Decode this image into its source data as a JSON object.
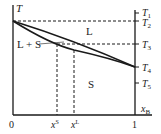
{
  "diagram": {
    "type": "binary phase diagram",
    "y_axis_label": "T",
    "x_axis_label": "x",
    "x_axis_label_sub": "B",
    "x_ticks": {
      "zero": "0",
      "one": "1"
    },
    "composition_labels": {
      "solid": {
        "base": "x",
        "sup": "S"
      },
      "liquid": {
        "base": "x",
        "sup": "L"
      }
    },
    "temperature_labels": [
      {
        "base": "T",
        "sub": "1"
      },
      {
        "base": "T",
        "sub": "2"
      },
      {
        "base": "T",
        "sub": "3"
      },
      {
        "base": "T",
        "sub": "4"
      },
      {
        "base": "T",
        "sub": "5"
      }
    ],
    "regions": {
      "liquid": "L",
      "two_phase": "L + S",
      "solid": "S"
    },
    "colors": {
      "line": "#1a1a1a",
      "background": "#ffffff"
    }
  }
}
